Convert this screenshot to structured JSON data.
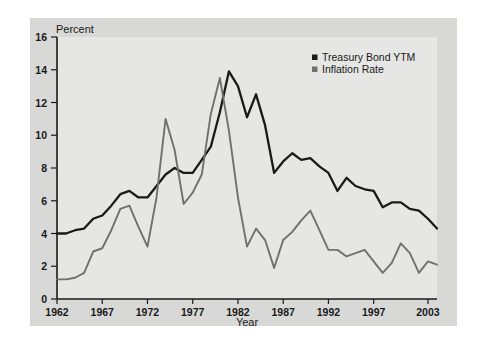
{
  "chart_data": {
    "type": "line",
    "title": "",
    "subtitle": "",
    "ylabel": "Percent",
    "xlabel": "Year",
    "ylim": [
      0,
      16
    ],
    "xlim": [
      1962,
      2004
    ],
    "grid": false,
    "legend_position": "top-right",
    "y_ticks": [
      "0",
      "2",
      "4",
      "6",
      "8",
      "10",
      "12",
      "14",
      "16"
    ],
    "y_tick_values": [
      0,
      2,
      4,
      6,
      8,
      10,
      12,
      14,
      16
    ],
    "x_ticks": [
      "1962",
      "1967",
      "1972",
      "1977",
      "1982",
      "1987",
      "1992",
      "1997",
      "2003"
    ],
    "x_tick_values": [
      1962,
      1967,
      1972,
      1977,
      1982,
      1987,
      1992,
      1997,
      2003
    ],
    "x": [
      1962,
      1963,
      1964,
      1965,
      1966,
      1967,
      1968,
      1969,
      1970,
      1971,
      1972,
      1973,
      1974,
      1975,
      1976,
      1977,
      1978,
      1979,
      1980,
      1981,
      1982,
      1983,
      1984,
      1985,
      1986,
      1987,
      1988,
      1989,
      1990,
      1991,
      1992,
      1993,
      1994,
      1995,
      1996,
      1997,
      1998,
      1999,
      2000,
      2001,
      2002,
      2003,
      2004
    ],
    "series": [
      {
        "name": "Treasury Bond YTM",
        "color": "#1a1a1a",
        "values": [
          4.0,
          4.0,
          4.2,
          4.3,
          4.9,
          5.1,
          5.7,
          6.4,
          6.6,
          6.2,
          6.2,
          6.9,
          7.6,
          8.0,
          7.7,
          7.7,
          8.5,
          9.3,
          11.4,
          13.9,
          13.0,
          11.1,
          12.5,
          10.6,
          7.7,
          8.4,
          8.9,
          8.5,
          8.6,
          8.1,
          7.7,
          6.6,
          7.4,
          6.9,
          6.7,
          6.6,
          5.6,
          5.9,
          5.9,
          5.5,
          5.4,
          4.9,
          4.3
        ]
      },
      {
        "name": "Inflation Rate",
        "color": "#707070",
        "values": [
          1.2,
          1.2,
          1.3,
          1.6,
          2.9,
          3.1,
          4.2,
          5.5,
          5.7,
          4.4,
          3.2,
          6.2,
          11.0,
          9.1,
          5.8,
          6.5,
          7.6,
          11.3,
          13.5,
          10.3,
          6.2,
          3.2,
          4.3,
          3.6,
          1.9,
          3.6,
          4.1,
          4.8,
          5.4,
          4.2,
          3.0,
          3.0,
          2.6,
          2.8,
          3.0,
          2.3,
          1.6,
          2.2,
          3.4,
          2.8,
          1.6,
          2.3,
          2.1
        ]
      }
    ]
  },
  "legend": {
    "items": [
      {
        "label": "Treasury Bond YTM",
        "marker": "square-marker",
        "color": "#1a1a1a"
      },
      {
        "label": "Inflation Rate",
        "marker": "square-marker",
        "color": "#707070"
      }
    ]
  },
  "axes": {
    "y_axis_title": "Percent",
    "x_axis_title": "Year"
  }
}
